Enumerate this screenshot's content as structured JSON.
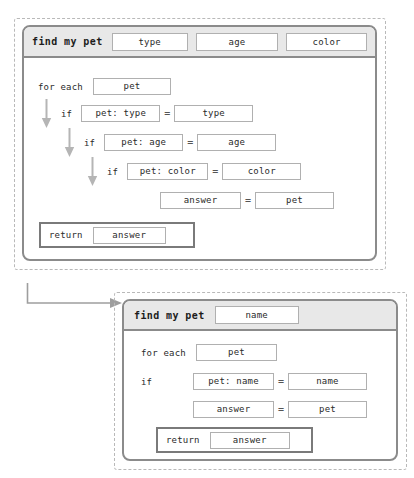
{
  "canvas": {
    "width": 414,
    "height": 478,
    "background": "#ffffff",
    "frame_border_color": "#b9b9b9",
    "card_border_color": "#8b8b8b",
    "header_background": "#e8e8e8",
    "slot_border_color": "#b0b0b0",
    "text_color": "#2a2a2a"
  },
  "diagram_one": {
    "header": {
      "function_name": "find my pet",
      "parameters": [
        {
          "label": "type"
        },
        {
          "label": "age"
        },
        {
          "label": "color"
        }
      ]
    },
    "body": {
      "loop": {
        "keyword": "for each",
        "variable": "pet"
      },
      "conditions": [
        {
          "arrow": "down-arrow",
          "keyword": "if",
          "left": "pet: type",
          "operator": "=",
          "right": "type"
        },
        {
          "arrow": "down-arrow",
          "keyword": "if",
          "left": "pet: age",
          "operator": "=",
          "right": "age"
        },
        {
          "arrow": "down-arrow",
          "keyword": "if",
          "left": "pet: color",
          "operator": "=",
          "right": "color"
        }
      ],
      "assignment": {
        "left": "answer",
        "operator": "=",
        "right": "pet"
      },
      "return_statement": {
        "keyword": "return",
        "value": "answer"
      }
    }
  },
  "connector": {
    "name": "elbow-arrow",
    "direction": "right"
  },
  "diagram_two": {
    "header": {
      "function_name": "find my pet",
      "parameters": [
        {
          "label": "name"
        }
      ]
    },
    "body": {
      "loop": {
        "keyword": "for each",
        "variable": "pet"
      },
      "conditions": [
        {
          "keyword": "if",
          "left": "pet: name",
          "operator": "=",
          "right": "name"
        }
      ],
      "assignment": {
        "left": "answer",
        "operator": "=",
        "right": "pet"
      },
      "return_statement": {
        "keyword": "return",
        "value": "answer"
      }
    }
  }
}
